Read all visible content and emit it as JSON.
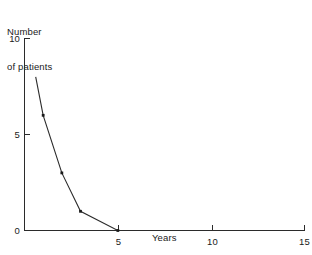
{
  "figure": {
    "background_color": "#ffffff",
    "ink_color": "#2b2b2b"
  },
  "labels": {
    "y_axis_title_line1": "Number",
    "y_axis_title_line2": "of patients",
    "x_axis_title": "Years"
  },
  "axes": {
    "y_ticks": [
      {
        "value": 0,
        "label": "0"
      },
      {
        "value": 5,
        "label": "5"
      },
      {
        "value": 10,
        "label": "10"
      }
    ],
    "x_ticks": [
      {
        "value": 5,
        "label": "5"
      },
      {
        "value": 10,
        "label": "10"
      },
      {
        "value": 15,
        "label": "15"
      }
    ]
  },
  "chart_data": {
    "type": "line",
    "title": "",
    "subtitle": "",
    "xlabel": "Years",
    "ylabel": "Number of patients",
    "xlim": [
      0,
      15
    ],
    "ylim": [
      0,
      10
    ],
    "grid": false,
    "legend": false,
    "x": [
      0.6,
      1,
      2,
      3,
      5,
      15
    ],
    "y": [
      8,
      6,
      3,
      1,
      0,
      0
    ],
    "marker_points": [
      {
        "x": 1,
        "y": 6
      },
      {
        "x": 2,
        "y": 3
      },
      {
        "x": 3,
        "y": 1
      },
      {
        "x": 5,
        "y": 0
      }
    ],
    "series": [
      {
        "name": "Number of patients",
        "x": [
          0.6,
          1,
          2,
          3,
          5,
          15
        ],
        "values": [
          8,
          6,
          3,
          1,
          0,
          0
        ]
      }
    ],
    "y_tick_labels": [
      "0",
      "5",
      "10"
    ],
    "x_tick_labels": [
      "5",
      "10",
      "15"
    ],
    "x_tick_values": [
      5,
      10,
      15
    ],
    "y_tick_values": [
      0,
      5,
      10
    ],
    "annotations": []
  }
}
